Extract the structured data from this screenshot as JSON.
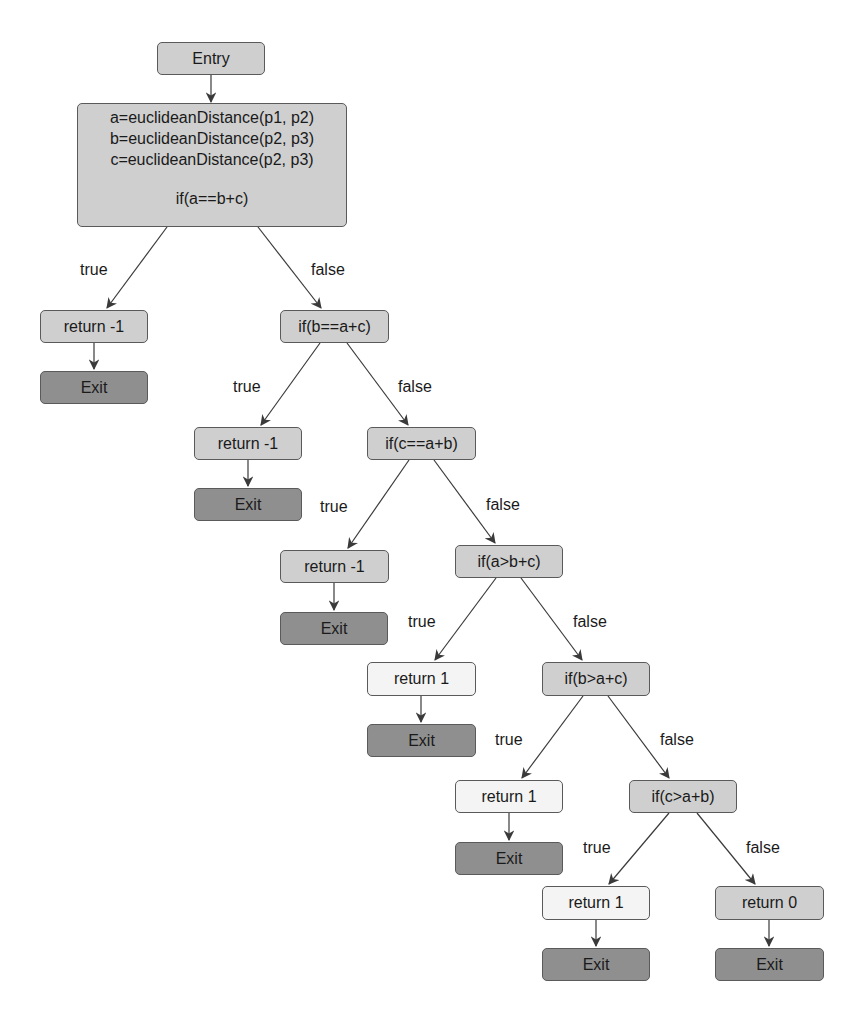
{
  "diagram": {
    "type": "control-flow-graph",
    "colors": {
      "edge": "#3a3a3a",
      "border": "#5a5a5a",
      "node_mid": "#cfcfcf",
      "node_light": "#f4f4f4",
      "node_exit": "#8f8f8f"
    },
    "nodes": {
      "entry": {
        "label": "Entry"
      },
      "init": {
        "lines": [
          "a=euclideanDistance(p1, p2)",
          "b=euclideanDistance(p2, p3)",
          "c=euclideanDistance(p2, p3)"
        ],
        "condition": "if(a==b+c)"
      },
      "ret1": {
        "label": "return -1"
      },
      "exit1": {
        "label": "Exit"
      },
      "cond2": {
        "label": "if(b==a+c)"
      },
      "ret2": {
        "label": "return -1"
      },
      "exit2": {
        "label": "Exit"
      },
      "cond3": {
        "label": "if(c==a+b)"
      },
      "ret3": {
        "label": "return -1"
      },
      "exit3": {
        "label": "Exit"
      },
      "cond4": {
        "label": "if(a>b+c)"
      },
      "ret4": {
        "label": "return 1"
      },
      "exit4": {
        "label": "Exit"
      },
      "cond5": {
        "label": "if(b>a+c)"
      },
      "ret5": {
        "label": "return 1"
      },
      "exit5": {
        "label": "Exit"
      },
      "cond6": {
        "label": "if(c>a+b)"
      },
      "ret6": {
        "label": "return 1"
      },
      "exit6": {
        "label": "Exit"
      },
      "ret7": {
        "label": "return 0"
      },
      "exit7": {
        "label": "Exit"
      }
    },
    "edge_labels": {
      "e1_true": "true",
      "e1_false": "false",
      "e2_true": "true",
      "e2_false": "false",
      "e3_true": "true",
      "e3_false": "false",
      "e4_true": "true",
      "e4_false": "false",
      "e5_true": "true",
      "e5_false": "false",
      "e6_true": "true",
      "e6_false": "false"
    },
    "edges": [
      {
        "from": "entry",
        "to": "init",
        "label": ""
      },
      {
        "from": "init",
        "to": "ret1",
        "label": "true"
      },
      {
        "from": "init",
        "to": "cond2",
        "label": "false"
      },
      {
        "from": "ret1",
        "to": "exit1",
        "label": ""
      },
      {
        "from": "cond2",
        "to": "ret2",
        "label": "true"
      },
      {
        "from": "cond2",
        "to": "cond3",
        "label": "false"
      },
      {
        "from": "ret2",
        "to": "exit2",
        "label": ""
      },
      {
        "from": "cond3",
        "to": "ret3",
        "label": "true"
      },
      {
        "from": "cond3",
        "to": "cond4",
        "label": "false"
      },
      {
        "from": "ret3",
        "to": "exit3",
        "label": ""
      },
      {
        "from": "cond4",
        "to": "ret4",
        "label": "true"
      },
      {
        "from": "cond4",
        "to": "cond5",
        "label": "false"
      },
      {
        "from": "ret4",
        "to": "exit4",
        "label": ""
      },
      {
        "from": "cond5",
        "to": "ret5",
        "label": "true"
      },
      {
        "from": "cond5",
        "to": "cond6",
        "label": "false"
      },
      {
        "from": "ret5",
        "to": "exit5",
        "label": ""
      },
      {
        "from": "cond6",
        "to": "ret6",
        "label": "true"
      },
      {
        "from": "cond6",
        "to": "ret7",
        "label": "false"
      },
      {
        "from": "ret6",
        "to": "exit6",
        "label": ""
      },
      {
        "from": "ret7",
        "to": "exit7",
        "label": ""
      }
    ]
  }
}
